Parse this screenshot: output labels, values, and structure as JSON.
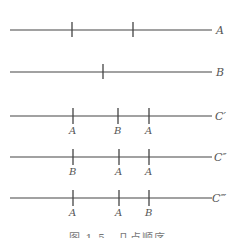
{
  "diagram": {
    "lines": [
      {
        "id": "A",
        "label": "A",
        "y": 30,
        "ticks": [
          72,
          133
        ],
        "tick_labels": []
      },
      {
        "id": "B",
        "label": "B",
        "y": 72,
        "ticks": [
          103
        ],
        "tick_labels": []
      },
      {
        "id": "C1",
        "label": "C′",
        "y": 116,
        "ticks": [
          73,
          118,
          149
        ],
        "tick_labels": [
          "A",
          "B",
          "A"
        ]
      },
      {
        "id": "C2",
        "label": "C″",
        "y": 157,
        "ticks": [
          73,
          119,
          149
        ],
        "tick_labels": [
          "B",
          "A",
          "A"
        ]
      },
      {
        "id": "C3",
        "label": "C‴",
        "y": 198,
        "ticks": [
          73,
          119,
          149
        ],
        "tick_labels": [
          "A",
          "A",
          "B"
        ]
      }
    ],
    "line_x_start": 10,
    "line_x_end": 212,
    "line_color": "#444444"
  },
  "caption": "图 1.5　几点顺序"
}
